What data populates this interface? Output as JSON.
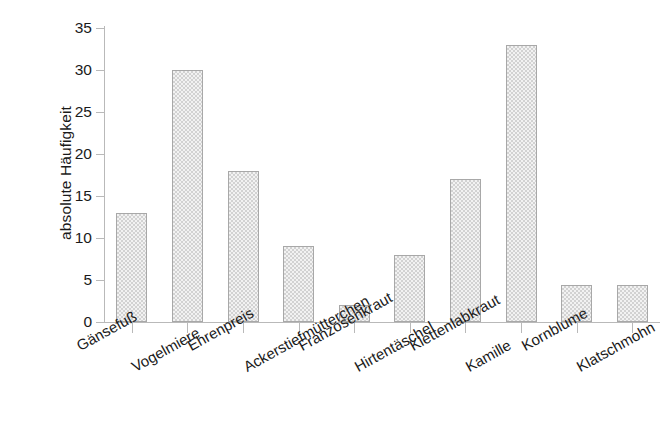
{
  "chart_data": {
    "type": "bar",
    "title": "",
    "subtitle": "",
    "xlabel": "",
    "ylabel": "absolute Häufigkeit",
    "ylim": [
      0,
      35
    ],
    "yticks": [
      0,
      5,
      10,
      15,
      20,
      25,
      30,
      35
    ],
    "grid": false,
    "legend": false,
    "categories": [
      "Gänsefuß",
      "Vogelmiere",
      "Ehrenpreis",
      "Ackerstiefmütterchen",
      "Franzosenkraut",
      "Hirtentäschel",
      "Klettenlabkraut",
      "Kamille",
      "Kornblume",
      "Klatschmohn"
    ],
    "values": [
      13,
      30,
      18,
      9,
      2,
      8,
      17,
      33,
      4.4,
      4.4
    ],
    "bar_fill_color": "#e4e4e4",
    "bar_border_color": "#a8a8a8",
    "axis_color": "#b9b9b9",
    "text_color": "#1a1a1a",
    "background_color": "#ffffff"
  },
  "axis": {
    "y_title": "absolute Häufigkeit",
    "tick_labels": [
      "0",
      "5",
      "10",
      "15",
      "20",
      "25",
      "30",
      "35"
    ]
  }
}
